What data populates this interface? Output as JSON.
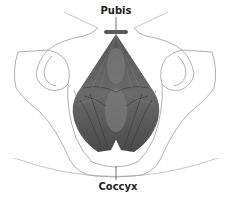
{
  "diagram": {
    "labels": {
      "top": "Pubis",
      "bottom": "Coccyx"
    },
    "colors": {
      "muscle_dark": "#4a4a4a",
      "muscle_mid": "#6e6e6e",
      "muscle_light": "#9a9a9a",
      "bone_outline": "#9c9c9c",
      "label_text": "#222222",
      "background": "#ffffff"
    }
  }
}
